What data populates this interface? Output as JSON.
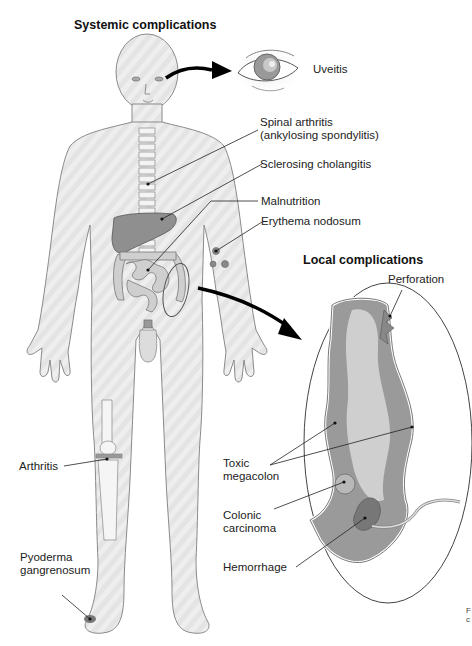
{
  "figure": {
    "titles": {
      "systemic": "Systemic complications",
      "local": "Local complications"
    },
    "systemic_labels": [
      {
        "id": "uveitis",
        "text": "Uveitis"
      },
      {
        "id": "spinal-arthritis",
        "line1": "Spinal arthritis",
        "line2": "(ankylosing spondylitis)"
      },
      {
        "id": "sclerosing-cholangitis",
        "text": "Sclerosing cholangitis"
      },
      {
        "id": "malnutrition",
        "text": "Malnutrition"
      },
      {
        "id": "erythema-nodosum",
        "text": "Erythema nodosum"
      },
      {
        "id": "arthritis",
        "text": "Arthritis"
      },
      {
        "id": "pyoderma",
        "line1": "Pyoderma",
        "line2": "gangrenosum"
      }
    ],
    "local_labels": [
      {
        "id": "perforation",
        "text": "Perforation"
      },
      {
        "id": "toxic-megacolon",
        "line1": "Toxic",
        "line2": "megacolon"
      },
      {
        "id": "colonic-carcinoma",
        "line1": "Colonic",
        "line2": "carcinoma"
      },
      {
        "id": "hemorrhage",
        "text": "Hemorrhage"
      }
    ],
    "edge_fragment": {
      "line1": "F",
      "line2": "c"
    },
    "colors": {
      "body_fill": "#e6e6e6",
      "outline": "#7a7a7a",
      "organ": "#8a8a8a",
      "arrow": "#000000"
    }
  }
}
